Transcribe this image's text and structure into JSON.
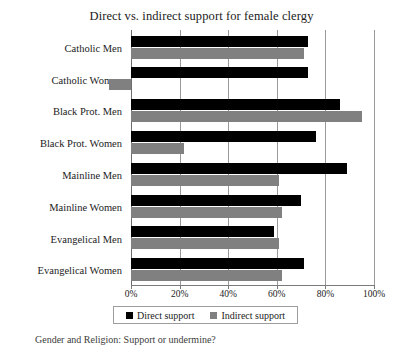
{
  "chart_data": {
    "type": "bar",
    "orientation": "horizontal",
    "title": "Direct vs. indirect support for female clergy",
    "xlabel": "",
    "ylabel": "",
    "xlim": [
      -10,
      100
    ],
    "axis_min_value": 0,
    "grid": true,
    "legend_position": "bottom",
    "categories": [
      "Catholic Men",
      "Catholic Women",
      "Black Prot. Men",
      "Black Prot. Women",
      "Mainline Men",
      "Mainline Women",
      "Evangelical Men",
      "Evangelical Women"
    ],
    "tick_labels": [
      "0%",
      "20%",
      "40%",
      "60%",
      "80%",
      "100%"
    ],
    "tick_values": [
      0,
      20,
      40,
      60,
      80,
      100
    ],
    "series": [
      {
        "name": "Direct support",
        "color": "#000000",
        "values": [
          73,
          73,
          86,
          76,
          89,
          70,
          59,
          71
        ]
      },
      {
        "name": "Indirect support",
        "color": "#808080",
        "values": [
          71,
          -9,
          95,
          22,
          61,
          62,
          61,
          62
        ]
      }
    ]
  },
  "legend": {
    "items": [
      {
        "label": "Direct support",
        "swatch": "direct"
      },
      {
        "label": "Indirect support",
        "swatch": "indirect"
      }
    ]
  },
  "caption": {
    "text": "Gender and Religion: Support or undermine?"
  }
}
